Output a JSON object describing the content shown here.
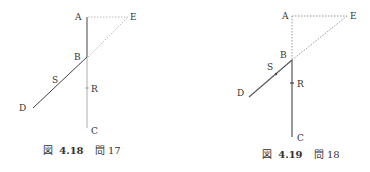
{
  "figures": [
    {
      "id": "fig-4-18",
      "caption": {
        "prefix": "図",
        "number": "4.18",
        "problem": "問 17"
      },
      "labels": {
        "A": "A",
        "B": "B",
        "C": "C",
        "D": "D",
        "E": "E",
        "R": "R",
        "S": "S"
      },
      "colors": {
        "solid": "#444444",
        "light": "#9a9a9a",
        "dotted": "#aaaaaa"
      }
    },
    {
      "id": "fig-4-19",
      "caption": {
        "prefix": "図",
        "number": "4.19",
        "problem": "問 18"
      },
      "labels": {
        "A": "A",
        "B": "B",
        "C": "C",
        "D": "D",
        "E": "E",
        "R": "R",
        "S": "S"
      },
      "colors": {
        "solid": "#555555",
        "dotted": "#999999"
      }
    }
  ]
}
